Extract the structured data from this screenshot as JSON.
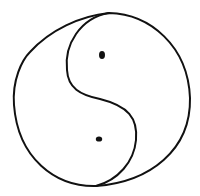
{
  "drawing": {
    "subject": "yin-yang sketch",
    "stroke_color": "#111111",
    "background": "#ffffff",
    "outer_circle": {
      "cx": 102,
      "cy": 99,
      "rx": 88,
      "ry": 87
    },
    "dots": [
      {
        "cx": 102,
        "cy": 55,
        "rx": 3,
        "ry": 4
      },
      {
        "cx": 99,
        "cy": 139,
        "rx": 3.2,
        "ry": 2.6
      }
    ]
  }
}
